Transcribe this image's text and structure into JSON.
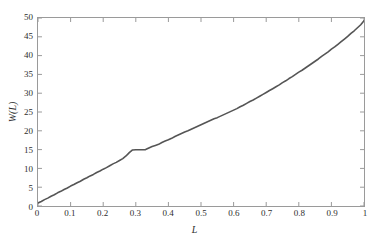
{
  "chart_data": {
    "type": "line",
    "title": "",
    "subtitle": "",
    "xlabel": "L",
    "ylabel": "W(L)",
    "xlim": [
      0,
      1
    ],
    "ylim": [
      0,
      50
    ],
    "grid": false,
    "legend": null,
    "legend_position": "none",
    "line_color": "#555555",
    "axis_color": "#9a9a9a",
    "frame": "box",
    "tick_direction": "in",
    "xticks": [
      0,
      0.1,
      0.2,
      0.3,
      0.4,
      0.5,
      0.6,
      0.7,
      0.8,
      0.9,
      1
    ],
    "xtick_labels": [
      "0",
      "0.1",
      "0.2",
      "0.3",
      "0.4",
      "0.5",
      "0.6",
      "0.7",
      "0.8",
      "0.9",
      "1"
    ],
    "yticks": [
      0,
      5,
      10,
      15,
      20,
      25,
      30,
      35,
      40,
      45,
      50
    ],
    "ytick_labels": [
      "0",
      "5",
      "10",
      "15",
      "20",
      "25",
      "30",
      "35",
      "40",
      "45",
      "50"
    ],
    "series": [
      {
        "name": "W(L)",
        "x": [
          0.0,
          0.01,
          0.02,
          0.03,
          0.04,
          0.05,
          0.06,
          0.07,
          0.08,
          0.09,
          0.1,
          0.11,
          0.12,
          0.13,
          0.14,
          0.15,
          0.16,
          0.17,
          0.18,
          0.19,
          0.2,
          0.21,
          0.22,
          0.23,
          0.24,
          0.25,
          0.26,
          0.27,
          0.28,
          0.29,
          0.3,
          0.31,
          0.32,
          0.33,
          0.34,
          0.35,
          0.36,
          0.37,
          0.38,
          0.39,
          0.4,
          0.41,
          0.42,
          0.43,
          0.44,
          0.45,
          0.46,
          0.47,
          0.48,
          0.49,
          0.5,
          0.51,
          0.52,
          0.53,
          0.54,
          0.55,
          0.56,
          0.57,
          0.58,
          0.59,
          0.6,
          0.61,
          0.62,
          0.63,
          0.64,
          0.65,
          0.66,
          0.67,
          0.68,
          0.69,
          0.7,
          0.71,
          0.72,
          0.73,
          0.74,
          0.75,
          0.76,
          0.77,
          0.78,
          0.79,
          0.8,
          0.81,
          0.82,
          0.83,
          0.84,
          0.85,
          0.86,
          0.87,
          0.88,
          0.89,
          0.9,
          0.91,
          0.92,
          0.93,
          0.94,
          0.95,
          0.96,
          0.97,
          0.98,
          0.99,
          1.0
        ],
        "y": [
          0.8,
          1.2,
          1.7,
          2.1,
          2.6,
          3.0,
          3.5,
          3.9,
          4.4,
          4.8,
          5.3,
          5.7,
          6.2,
          6.6,
          7.1,
          7.5,
          8.0,
          8.4,
          8.9,
          9.3,
          9.8,
          10.2,
          10.7,
          11.2,
          11.6,
          12.1,
          12.6,
          13.3,
          14.2,
          14.9,
          14.95,
          14.95,
          14.95,
          15.0,
          15.4,
          15.8,
          16.1,
          16.4,
          16.9,
          17.3,
          17.6,
          18.0,
          18.5,
          18.9,
          19.3,
          19.7,
          20.0,
          20.4,
          20.8,
          21.2,
          21.6,
          22.0,
          22.4,
          22.8,
          23.2,
          23.5,
          23.9,
          24.3,
          24.7,
          25.1,
          25.5,
          25.9,
          26.4,
          26.8,
          27.3,
          27.8,
          28.2,
          28.7,
          29.2,
          29.7,
          30.2,
          30.7,
          31.2,
          31.7,
          32.2,
          32.8,
          33.3,
          33.9,
          34.4,
          35.0,
          35.6,
          36.1,
          36.7,
          37.3,
          37.9,
          38.5,
          39.1,
          39.8,
          40.4,
          41.0,
          41.7,
          42.3,
          43.0,
          43.7,
          44.4,
          45.1,
          45.9,
          46.6,
          47.4,
          48.2,
          49.3
        ],
        "color": "#555555",
        "linewidth": 1.6,
        "marker": "none"
      }
    ],
    "annotations": [
      {
        "text": "plateau near L = 0.29 to 0.33 at W(L) ≈ 15",
        "visible": false
      }
    ]
  }
}
